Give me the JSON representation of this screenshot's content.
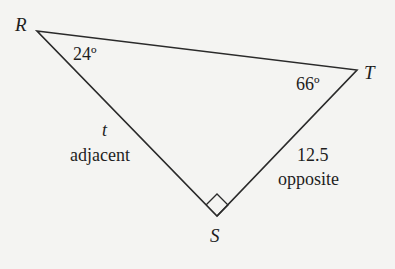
{
  "diagram": {
    "type": "right-triangle",
    "vertices": {
      "R": {
        "label": "R",
        "x": 37,
        "y": 31
      },
      "T": {
        "label": "T",
        "x": 357,
        "y": 70
      },
      "S": {
        "label": "S",
        "x": 217,
        "y": 216
      }
    },
    "angles": {
      "R": "24º",
      "T": "66º"
    },
    "right_angle_at": "S",
    "sides": {
      "RS": {
        "variable": "t",
        "role": "adjacent"
      },
      "ST": {
        "value": "12.5",
        "role": "opposite"
      }
    },
    "colors": {
      "stroke": "#2a2a2a",
      "background": "#f4f4f2",
      "text": "#1e1e1e"
    }
  }
}
